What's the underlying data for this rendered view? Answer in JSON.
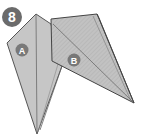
{
  "step": {
    "number": "8"
  },
  "flaps": [
    {
      "label": "A"
    },
    {
      "label": "B"
    }
  ],
  "colors": {
    "paper_fill": "#c4c4c4",
    "paper_fill_dark": "#b3b3b3",
    "edge": "#555555",
    "badge": "#6b6b6b",
    "badge_text": "#ffffff"
  }
}
